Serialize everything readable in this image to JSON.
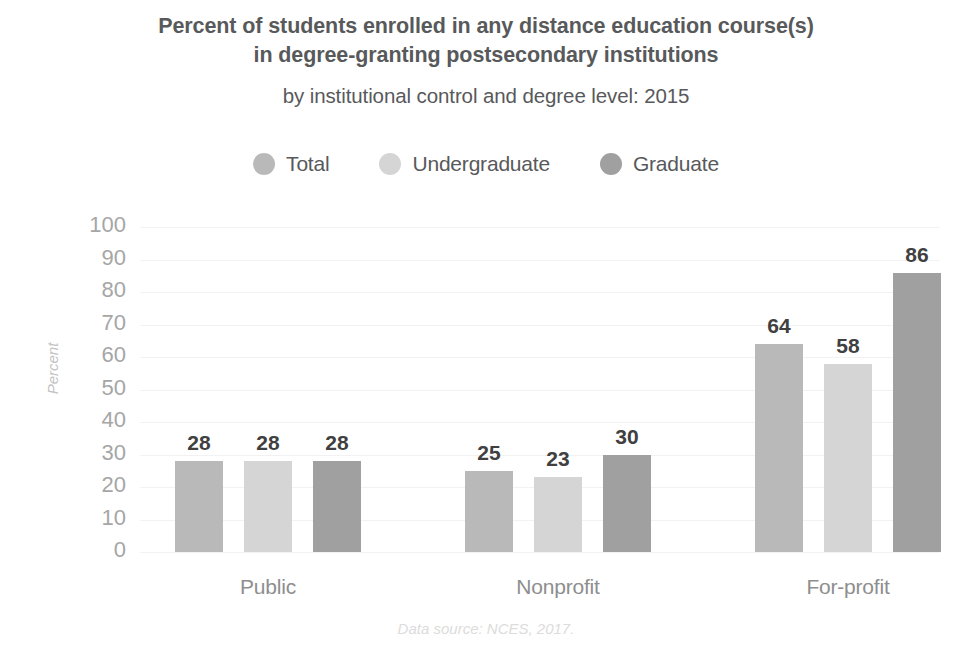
{
  "chart_data": {
    "type": "bar",
    "title": "Percent of students enrolled in any distance education course(s) in degree-granting postsecondary institutions",
    "title_line1": "Percent of students enrolled in any distance education course(s)",
    "title_line2": "in degree-granting postsecondary institutions",
    "subtitle": "by institutional control and degree level: 2015",
    "xlabel": "",
    "ylabel": "Percent",
    "categories": [
      "Public",
      "Nonprofit",
      "For-profit"
    ],
    "series": [
      {
        "name": "Total",
        "color": "#b9b9b9",
        "values": [
          28,
          25,
          64
        ]
      },
      {
        "name": "Undergraduate",
        "color": "#d5d5d5",
        "values": [
          28,
          23,
          58
        ]
      },
      {
        "name": "Graduate",
        "color": "#a0a0a0",
        "values": [
          28,
          30,
          86
        ]
      }
    ],
    "ylim": [
      0,
      100
    ],
    "yticks": [
      100,
      90,
      80,
      70,
      60,
      50,
      40,
      30,
      20,
      10,
      0
    ],
    "ytick_labels": [
      "100",
      "90",
      "80",
      "70",
      "60",
      "50",
      "40",
      "30",
      "20",
      "10",
      "0"
    ],
    "grid": true,
    "legend_position": "top",
    "source_note": "Data source: NCES, 2017."
  },
  "colors": {
    "text_dark": "#58595b",
    "value_label": "#404040",
    "tick": "#a6a6a6",
    "category": "#8e8e8e",
    "axis_title": "#c3c3c3",
    "gridline": "#f2f2f2",
    "source": "#dcdcdc",
    "background": "#ffffff"
  }
}
